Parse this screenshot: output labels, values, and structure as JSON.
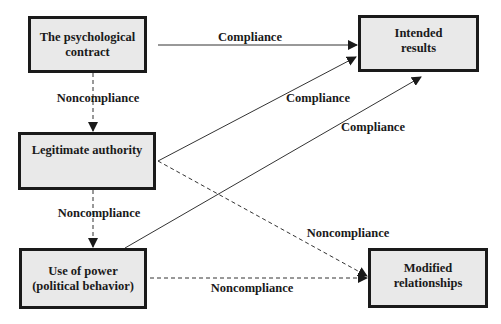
{
  "diagram": {
    "nodes": {
      "psychological_contract": {
        "line1": "The psychological",
        "line2": "contract"
      },
      "intended_results": {
        "line1": "Intended",
        "line2": "results"
      },
      "legitimate_authority": {
        "line1": "Legitimate authority"
      },
      "use_of_power": {
        "line1": "Use of power",
        "line2": "(political behavior)"
      },
      "modified_relationships": {
        "line1": "Modified",
        "line2": "relationships"
      }
    },
    "edges": [
      {
        "from": "psychological_contract",
        "to": "intended_results",
        "style": "solid",
        "label": "Compliance"
      },
      {
        "from": "legitimate_authority",
        "to": "intended_results",
        "style": "solid",
        "label": "Compliance"
      },
      {
        "from": "use_of_power",
        "to": "intended_results",
        "style": "solid",
        "label": "Compliance"
      },
      {
        "from": "psychological_contract",
        "to": "legitimate_authority",
        "style": "dashed",
        "label": "Noncompliance"
      },
      {
        "from": "legitimate_authority",
        "to": "use_of_power",
        "style": "dashed",
        "label": "Noncompliance"
      },
      {
        "from": "legitimate_authority",
        "to": "modified_relationships",
        "style": "dashed",
        "label": "Noncompliance"
      },
      {
        "from": "use_of_power",
        "to": "modified_relationships",
        "style": "dashed",
        "label": "Noncompliance"
      }
    ],
    "colors": {
      "box_fill": "#e9e9e9",
      "border": "#1a1a1a",
      "line": "#333333"
    }
  }
}
